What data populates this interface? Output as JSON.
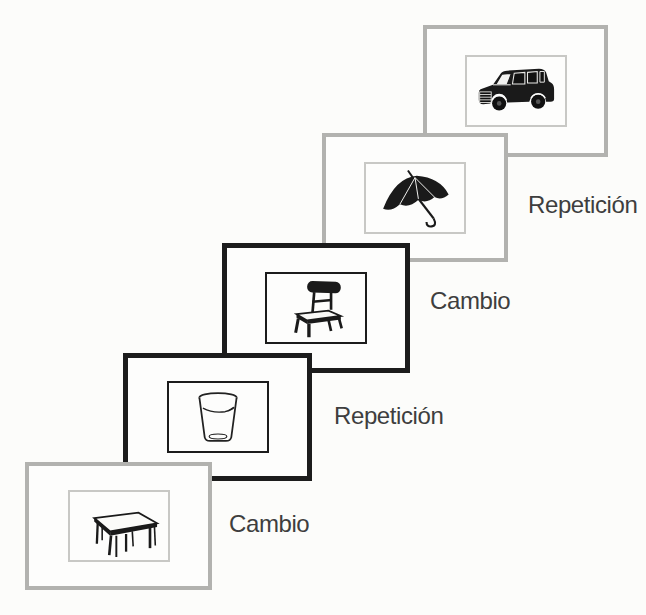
{
  "figure": {
    "description_domain": "stimulus-sequence-diagram",
    "background_color": "#fcfcfa",
    "colors": {
      "gray_frame": "#b2b2af",
      "black_frame": "#1c1c1c",
      "inner_mat_gray": "#c8c8c5",
      "label_text": "#3e3e3e",
      "drawing_ink": "#1a1a1a",
      "card_background": "#fdfdfc"
    },
    "cards": [
      {
        "id": "car",
        "icon": "suv-car-icon",
        "frame_style": "gray",
        "label": ""
      },
      {
        "id": "umbrella",
        "icon": "umbrella-icon",
        "frame_style": "gray",
        "label": "Repetición"
      },
      {
        "id": "chair",
        "icon": "chair-icon",
        "frame_style": "black",
        "label": "Cambio"
      },
      {
        "id": "glass",
        "icon": "drinking-glass-icon",
        "frame_style": "black",
        "label": "Repetición"
      },
      {
        "id": "table",
        "icon": "table-icon",
        "frame_style": "gray",
        "label": "Cambio"
      }
    ]
  }
}
